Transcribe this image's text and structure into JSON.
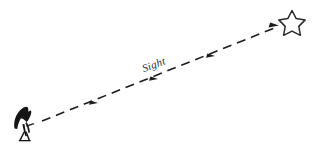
{
  "diagram": {
    "background_color": "#ffffff",
    "ink_color": "#1c1c1c",
    "label_color": "#2b2b2b",
    "observer": {
      "name": "observer-figure",
      "description": "person looking upward",
      "x": 24,
      "y": 122
    },
    "target": {
      "name": "star",
      "description": "five pointed star outline",
      "x": 292,
      "y": 22,
      "size": 22
    },
    "sight_line": {
      "label": "Sight",
      "label_x": 155,
      "label_y": 68,
      "label_rotation": -20,
      "style": "dashed",
      "dash_pattern": "9 6",
      "stroke_width": 1.6,
      "start_x": 42,
      "start_y": 121,
      "end_x": 278,
      "end_y": 27,
      "arrowheads": [
        {
          "x": 98,
          "y": 103,
          "label": "arrow-1"
        },
        {
          "x": 158,
          "y": 79,
          "label": "arrow-2"
        },
        {
          "x": 215,
          "y": 56,
          "label": "arrow-3"
        },
        {
          "x": 274,
          "y": 25,
          "label": "arrow-tip"
        }
      ]
    }
  }
}
